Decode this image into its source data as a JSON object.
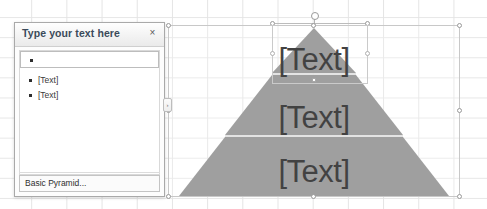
{
  "app": {
    "background": "spreadsheet-grid",
    "grid_color": "#e4e4e4"
  },
  "text_pane": {
    "title": "Type your text here",
    "close_label": "×",
    "close_icon": "close-icon",
    "collapse_tab_glyph": "›",
    "bullets": [
      {
        "text": "",
        "active": true
      },
      {
        "text": "[Text]",
        "active": false
      },
      {
        "text": "[Text]",
        "active": false
      }
    ],
    "footer_caption": "Basic Pyramid...",
    "border_color": "#a9a9a9",
    "title_color": "#3b4a5a"
  },
  "smartart": {
    "layout_name": "Basic Pyramid",
    "selected": true,
    "fill_color": "#858585",
    "divider_color": "#d7d7d7",
    "label_color": "#0d0d0d",
    "tiers": [
      {
        "level": 1,
        "label": "[Text]"
      },
      {
        "level": 2,
        "label": "[Text]"
      },
      {
        "level": 3,
        "label": "[Text]"
      }
    ],
    "selection": {
      "frame_color": "#c8c8c8",
      "handle_fill": "#ffffff",
      "handle_border": "#9a9a9a",
      "rotation_handle": "rotation-handle"
    }
  }
}
